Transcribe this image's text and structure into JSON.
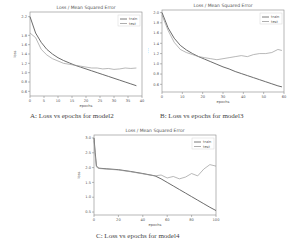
{
  "figures": [
    {
      "id": "A",
      "caption": "A: Loss vs epochs for model2",
      "title": "Loss / Mean Squared Error",
      "xlabel": "epochs",
      "ylabel": "loss",
      "legend": [
        "train",
        "test"
      ]
    },
    {
      "id": "B",
      "caption": "B: Loss vs epochs for model3",
      "title": "Loss / Mean Squared Error",
      "xlabel": "epochs",
      "ylabel": "loss",
      "legend": [
        "train",
        "test"
      ]
    },
    {
      "id": "C",
      "caption": "C: Loss vs epochs for model4",
      "title": "Loss / Mean Squared Error",
      "xlabel": "epochs",
      "ylabel": "loss",
      "legend": [
        "train",
        "test"
      ]
    }
  ],
  "chart_data": [
    {
      "type": "line",
      "title": "Loss / Mean Squared Error",
      "xlabel": "epochs",
      "ylabel": "loss",
      "xticks": [
        0,
        5,
        10,
        15,
        20,
        25,
        30,
        35,
        40
      ],
      "yticks": [
        0.6,
        0.8,
        1.0,
        1.2,
        1.4,
        1.6,
        1.8,
        2.2
      ],
      "xlim": [
        0,
        40
      ],
      "ylim": [
        0.5,
        2.3
      ],
      "legend_position": "upper right",
      "x": [
        0,
        2,
        4,
        6,
        8,
        10,
        12,
        14,
        16,
        18,
        20,
        22,
        24,
        26,
        28,
        30,
        32,
        34,
        36,
        38
      ],
      "series": [
        {
          "name": "train",
          "values": [
            2.2,
            1.85,
            1.65,
            1.5,
            1.4,
            1.32,
            1.26,
            1.21,
            1.16,
            1.12,
            1.08,
            1.04,
            1.0,
            0.96,
            0.92,
            0.88,
            0.84,
            0.8,
            0.76,
            0.72
          ]
        },
        {
          "name": "test",
          "values": [
            1.85,
            1.75,
            1.5,
            1.38,
            1.3,
            1.25,
            1.2,
            1.18,
            1.16,
            1.14,
            1.12,
            1.1,
            1.1,
            1.08,
            1.09,
            1.07,
            1.08,
            1.1,
            1.09,
            1.1
          ]
        }
      ]
    },
    {
      "type": "line",
      "title": "Loss / Mean Squared Error",
      "xlabel": "epochs",
      "ylabel": "loss",
      "xticks": [
        0,
        10,
        20,
        30,
        40,
        50,
        60
      ],
      "yticks": [
        0.6,
        0.8,
        1.0,
        1.2,
        1.4,
        1.6,
        1.8,
        2.0
      ],
      "xlim": [
        0,
        60
      ],
      "ylim": [
        0.45,
        2.05
      ],
      "legend_position": "upper right",
      "x": [
        0,
        3,
        6,
        9,
        12,
        15,
        18,
        21,
        24,
        27,
        30,
        33,
        36,
        39,
        42,
        45,
        48,
        51,
        54,
        57,
        59
      ],
      "series": [
        {
          "name": "train",
          "values": [
            2.0,
            1.7,
            1.5,
            1.36,
            1.27,
            1.2,
            1.14,
            1.09,
            1.04,
            0.99,
            0.94,
            0.9,
            0.85,
            0.81,
            0.77,
            0.73,
            0.69,
            0.65,
            0.61,
            0.57,
            0.55
          ]
        },
        {
          "name": "test",
          "values": [
            1.95,
            1.65,
            1.42,
            1.28,
            1.22,
            1.18,
            1.14,
            1.12,
            1.1,
            1.08,
            1.1,
            1.12,
            1.14,
            1.16,
            1.14,
            1.18,
            1.2,
            1.2,
            1.22,
            1.28,
            1.26
          ]
        }
      ]
    },
    {
      "type": "line",
      "title": "Loss / Mean Squared Error",
      "xlabel": "epochs",
      "ylabel": "loss",
      "xticks": [
        0,
        20,
        40,
        60,
        80,
        100
      ],
      "yticks": [
        0.5,
        1.0,
        1.5,
        2.0,
        2.5,
        3.0
      ],
      "xlim": [
        0,
        100
      ],
      "ylim": [
        0.4,
        3.1
      ],
      "legend_position": "upper right",
      "x": [
        0,
        1,
        2,
        4,
        10,
        20,
        30,
        40,
        50,
        55,
        60,
        65,
        70,
        75,
        80,
        85,
        90,
        95,
        100
      ],
      "series": [
        {
          "name": "train",
          "values": [
            3.0,
            2.5,
            2.05,
            1.98,
            1.96,
            1.93,
            1.87,
            1.8,
            1.72,
            1.62,
            1.5,
            1.38,
            1.26,
            1.14,
            1.02,
            0.9,
            0.78,
            0.66,
            0.55
          ]
        },
        {
          "name": "test",
          "values": [
            2.9,
            2.4,
            2.02,
            1.97,
            1.95,
            1.92,
            1.86,
            1.79,
            1.72,
            1.75,
            1.65,
            1.7,
            1.62,
            1.68,
            1.8,
            1.72,
            1.95,
            2.1,
            2.05
          ]
        }
      ]
    }
  ]
}
